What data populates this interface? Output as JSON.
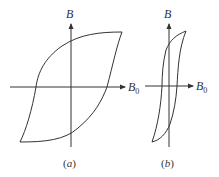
{
  "figure": {
    "panels": [
      {
        "id": "a",
        "caption_open": "(",
        "caption_letter": "a",
        "caption_close": ")",
        "y_axis_label": "B",
        "x_axis_label": "B",
        "x_axis_subscript": "0"
      },
      {
        "id": "b",
        "caption_open": "(",
        "caption_letter": "b",
        "caption_close": ")",
        "y_axis_label": "B",
        "x_axis_label": "B",
        "x_axis_subscript": "0"
      }
    ],
    "colors": {
      "line": "#333333",
      "background": "#ffffff"
    }
  }
}
